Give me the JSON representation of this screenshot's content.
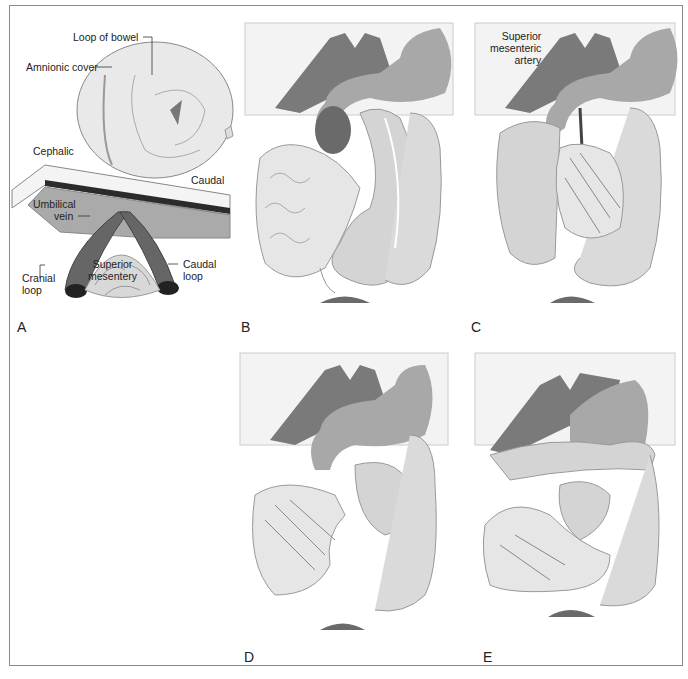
{
  "figure": {
    "panels": [
      {
        "id": "A",
        "label": "A",
        "callouts": {
          "loop_of_bowel": "Loop of bowel",
          "amnionic_cover": "Amnionic cover",
          "cephalic": "Cephalic",
          "caudal": "Caudal",
          "umbilical_vein_1": "Umbilical",
          "umbilical_vein_2": "vein",
          "superior_mesentery_1": "Superior",
          "superior_mesentery_2": "mesentery",
          "cranial_loop_1": "Cranial",
          "cranial_loop_2": "loop",
          "caudal_loop_1": "Caudal",
          "caudal_loop_2": "loop"
        }
      },
      {
        "id": "B",
        "label": "B"
      },
      {
        "id": "C",
        "label": "C",
        "callouts": {
          "sma_1": "Superior",
          "sma_2": "mesenteric",
          "sma_3": "artery"
        }
      },
      {
        "id": "D",
        "label": "D"
      },
      {
        "id": "E",
        "label": "E"
      }
    ],
    "colors": {
      "frame": "#8a8a8a",
      "liver": "#7a7a7a",
      "stomach": "#a8a8a8",
      "bowel": "#d4d4d4",
      "small_bowel": "#e6e6e6",
      "vessel": "#5e5e5e",
      "backdrop": "#f3f3f3"
    }
  }
}
